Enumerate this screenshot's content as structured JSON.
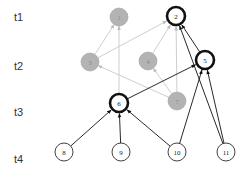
{
  "diagram": {
    "type": "layered-directed-graph",
    "time_labels": [
      {
        "id": "t1",
        "label": "t1",
        "x": 14,
        "y": 21
      },
      {
        "id": "t2",
        "label": "t2",
        "x": 14,
        "y": 70
      },
      {
        "id": "t3",
        "label": "t3",
        "x": 14,
        "y": 116
      },
      {
        "id": "t4",
        "label": "t4",
        "x": 14,
        "y": 163
      }
    ],
    "nodes": [
      {
        "id": "1",
        "label": "1",
        "x": 119,
        "y": 17,
        "style": "gray"
      },
      {
        "id": "2",
        "label": "2",
        "x": 176,
        "y": 16,
        "style": "bold"
      },
      {
        "id": "3",
        "label": "3",
        "x": 90,
        "y": 62,
        "style": "gray"
      },
      {
        "id": "4",
        "label": "4",
        "x": 148,
        "y": 61,
        "style": "gray"
      },
      {
        "id": "5",
        "label": "5",
        "x": 205,
        "y": 60,
        "style": "bold"
      },
      {
        "id": "6",
        "label": "6",
        "x": 119,
        "y": 103,
        "style": "bold"
      },
      {
        "id": "7",
        "label": "7",
        "x": 177,
        "y": 101,
        "style": "gray"
      },
      {
        "id": "8",
        "label": "8",
        "x": 64,
        "y": 152,
        "style": "plain"
      },
      {
        "id": "9",
        "label": "9",
        "x": 121,
        "y": 152,
        "style": "plain"
      },
      {
        "id": "10",
        "label": "10",
        "x": 177,
        "y": 152,
        "style": "plain"
      },
      {
        "id": "11",
        "label": "11",
        "x": 226,
        "y": 152,
        "style": "plain"
      }
    ],
    "edges": [
      {
        "from": "3",
        "to": "1",
        "style": "gray"
      },
      {
        "from": "3",
        "to": "2",
        "style": "gray"
      },
      {
        "from": "4",
        "to": "2",
        "style": "gray"
      },
      {
        "from": "7",
        "to": "2",
        "style": "gray"
      },
      {
        "from": "7",
        "to": "4",
        "style": "gray"
      },
      {
        "from": "7",
        "to": "3",
        "style": "gray"
      },
      {
        "from": "6",
        "to": "1",
        "style": "gray"
      },
      {
        "from": "6",
        "to": "5",
        "style": "black"
      },
      {
        "from": "5",
        "to": "2",
        "style": "black"
      },
      {
        "from": "11",
        "to": "2",
        "style": "black"
      },
      {
        "from": "11",
        "to": "5",
        "style": "black"
      },
      {
        "from": "10",
        "to": "5",
        "style": "black"
      },
      {
        "from": "8",
        "to": "6",
        "style": "black"
      },
      {
        "from": "9",
        "to": "6",
        "style": "black"
      },
      {
        "from": "10",
        "to": "6",
        "style": "black"
      }
    ],
    "colors": {
      "gray_fill": "#b3b3b3",
      "gray_stroke": "#a0a0a0",
      "gray_edge": "#c8c8c8",
      "black": "#111111",
      "white": "#ffffff"
    }
  }
}
